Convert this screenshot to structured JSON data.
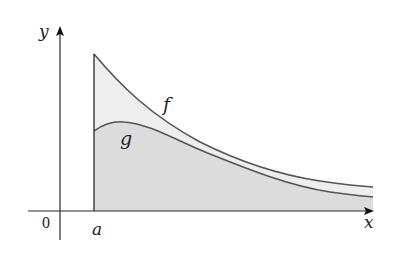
{
  "diagram": {
    "type": "area-between-curves",
    "axes": {
      "x_label": "x",
      "y_label": "y",
      "origin_label": "0"
    },
    "left_bound_label": "a",
    "curves": [
      {
        "name": "f",
        "label": "f",
        "description": "upper decreasing curve starting at x=a"
      },
      {
        "name": "g",
        "label": "g",
        "description": "lower curve rising slightly then decreasing"
      }
    ],
    "colors": {
      "axis": "#2a2a2a",
      "curve": "#555555",
      "region_between": "#eeeeee",
      "region_under_g": "#dcdcdc"
    }
  }
}
